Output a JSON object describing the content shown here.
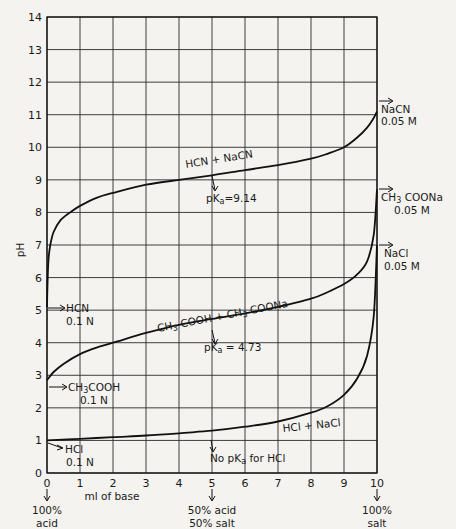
{
  "chart_data": {
    "type": "line",
    "title": "",
    "xlabel": "ml of base",
    "ylabel": "pH",
    "xlim": [
      0,
      10
    ],
    "ylim": [
      0,
      14
    ],
    "grid": true,
    "x_ticks": [
      "0",
      "1",
      "2",
      "3",
      "4",
      "5",
      "6",
      "7",
      "8",
      "9",
      "10"
    ],
    "y_ticks": [
      "0",
      "1",
      "2",
      "3",
      "4",
      "5",
      "6",
      "7",
      "8",
      "9",
      "10",
      "11",
      "12",
      "13",
      "14"
    ],
    "x_annotations": [
      {
        "x": 0,
        "text": [
          "100%",
          "acid"
        ]
      },
      {
        "x": 5,
        "text": [
          "50% acid",
          "50% salt"
        ]
      },
      {
        "x": 10,
        "text": [
          "100%",
          "salt"
        ]
      }
    ],
    "series": [
      {
        "name": "HCN 0.1 N titrated (HCN + NaCN)",
        "x": [
          0,
          0.02,
          0.05,
          0.1,
          0.2,
          0.4,
          0.7,
          1,
          1.5,
          2,
          3,
          4,
          5,
          6,
          7,
          8,
          8.5,
          9,
          9.4,
          9.7,
          9.9,
          10
        ],
        "y": [
          5.1,
          6.0,
          6.6,
          7.0,
          7.4,
          7.75,
          8.0,
          8.2,
          8.45,
          8.6,
          8.85,
          9.0,
          9.14,
          9.3,
          9.45,
          9.65,
          9.8,
          10.0,
          10.3,
          10.6,
          10.9,
          11.1
        ]
      },
      {
        "name": "CH3COOH 0.1 N titrated (CH3COOH + CH3COONa)",
        "x": [
          0,
          0.2,
          0.5,
          1,
          1.5,
          2,
          3,
          4,
          5,
          6,
          7,
          8,
          8.5,
          9,
          9.4,
          9.7,
          9.9,
          10
        ],
        "y": [
          2.85,
          3.1,
          3.35,
          3.65,
          3.85,
          4.0,
          4.3,
          4.55,
          4.73,
          4.9,
          5.1,
          5.35,
          5.55,
          5.8,
          6.1,
          6.5,
          7.3,
          8.7
        ]
      },
      {
        "name": "HCl 0.1 N titrated (HCl + NaCl)",
        "x": [
          0,
          1,
          2,
          3,
          4,
          5,
          6,
          7,
          8,
          8.5,
          9,
          9.4,
          9.7,
          9.9,
          10
        ],
        "y": [
          1.0,
          1.05,
          1.1,
          1.15,
          1.22,
          1.3,
          1.42,
          1.58,
          1.85,
          2.05,
          2.4,
          2.9,
          3.6,
          4.8,
          7.0
        ]
      }
    ],
    "annotations": [
      {
        "text": "HCN + NaCN",
        "near_x": 6,
        "near_y": 9.4
      },
      {
        "text": "pKa = 9.14",
        "x": 5,
        "y": 9.14
      },
      {
        "text": "CH3 COOH + CH3 COONa",
        "near_x": 5,
        "near_y": 5.2
      },
      {
        "text": "pKa = 4.73",
        "x": 5,
        "y": 4.73
      },
      {
        "text": "HCl + NaCl",
        "near_x": 6,
        "near_y": 1.8
      },
      {
        "text": "No pKa for HCl",
        "x": 5,
        "y": 1.3
      },
      {
        "text": "HCN 0.1 N",
        "x": 0,
        "y": 5.1
      },
      {
        "text": "CH3COOH 0.1 N",
        "x": 0,
        "y": 2.85
      },
      {
        "text": "HCl 0.1 N",
        "x": 0,
        "y": 1.0
      },
      {
        "text": "NaCN 0.05 M",
        "x": 10,
        "y": 11.1
      },
      {
        "text": "CH3COONa 0.05 M",
        "x": 10,
        "y": 8.5
      },
      {
        "text": "NaCl 0.05 M",
        "x": 10,
        "y": 7.0
      }
    ]
  },
  "labels": {
    "ylabel": "pH",
    "xlabel": "ml of base",
    "hcn_curve": "HCN + NaCN",
    "hcn_pka": "pK",
    "hcn_pka_sub": "a",
    "hcn_pka_val": "=9.14",
    "ac_curve_a": "CH",
    "ac_curve_b": "3",
    "ac_curve_c": " COOH + CH",
    "ac_curve_d": "3",
    "ac_curve_e": " COONa",
    "ac_pka": "pK",
    "ac_pka_sub": "a",
    "ac_pka_val": " = 4.73",
    "hcl_curve": "HCl + NaCl",
    "hcl_pka_a": "No pK",
    "hcl_pka_sub": "a",
    "hcl_pka_b": " for HCl",
    "start_hcn_1": "HCN",
    "start_hcn_2": "0.1 N",
    "start_ac_1a": "CH",
    "start_ac_1b": "3",
    "start_ac_1c": "COOH",
    "start_ac_2": "0.1 N",
    "start_hcl_1": "HCl",
    "start_hcl_2": "0.1 N",
    "end_nacn_1": "NaCN",
    "end_nacn_2": "0.05 M",
    "end_ac_1a": "CH",
    "end_ac_1b": "3",
    "end_ac_1c": " COONa",
    "end_ac_2": "0.05 M",
    "end_nacl_1": "NaCl",
    "end_nacl_2": "0.05 M",
    "x0_1": "100%",
    "x0_2": "acid",
    "x5_1": "50% acid",
    "x5_2": "50% salt",
    "x10_1": "100%",
    "x10_2": "salt"
  }
}
